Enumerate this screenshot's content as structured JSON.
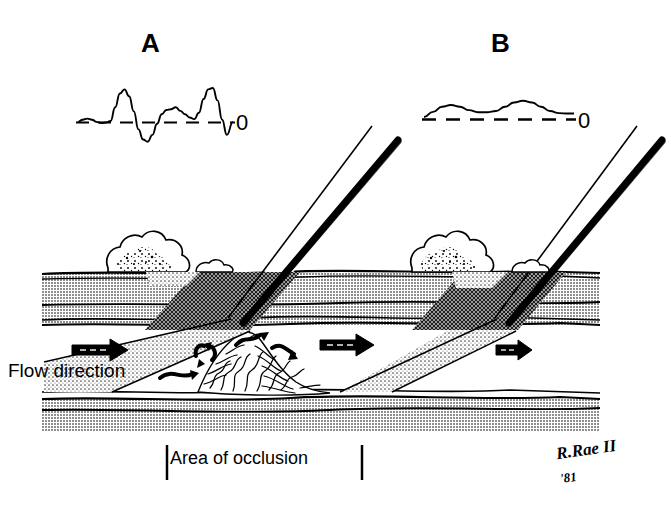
{
  "figure": {
    "panels": [
      {
        "id": "A",
        "label": "A",
        "zero_label": "0",
        "waveform_description": "high-amplitude biphasic turbulent spectral Doppler trace with spectral broadening",
        "baseline": "dashed"
      },
      {
        "id": "B",
        "label": "B",
        "zero_label": "0",
        "waveform_description": "low-amplitude damped monophasic spectral Doppler trace",
        "baseline": "dashed"
      }
    ],
    "annotations": {
      "flow_direction": "Flow direction",
      "area_of_occlusion": "Area of occlusion"
    },
    "signature": {
      "artist": "R.Rae II",
      "year": "'81"
    },
    "colors": {
      "ink": "#000000",
      "tissue_gray": "#a8a8a8",
      "beam_stipple": "#c9c9c9",
      "background": "#ffffff"
    }
  },
  "chart_data": [
    {
      "type": "line",
      "title": "A",
      "xlabel": "",
      "ylabel": "",
      "ylim": [
        -1.0,
        1.25
      ],
      "grid": false,
      "legend": "none",
      "baseline_value": 0,
      "baseline_label": "0",
      "baseline_style": "dashed",
      "x": [
        0,
        3,
        6,
        9,
        12,
        15,
        18,
        21,
        24,
        27,
        30,
        33,
        36,
        39,
        42,
        45,
        48,
        51,
        54,
        57,
        60,
        63,
        66,
        69,
        72,
        75,
        78,
        81,
        84,
        87,
        90,
        93,
        96,
        100
      ],
      "values": [
        0.02,
        0.1,
        0.14,
        0.1,
        0.02,
        -0.02,
        0.0,
        0.05,
        0.55,
        1.05,
        1.2,
        0.95,
        0.4,
        -0.25,
        -0.62,
        -0.7,
        -0.45,
        -0.05,
        0.3,
        0.45,
        0.48,
        0.55,
        0.42,
        0.3,
        0.18,
        0.12,
        0.35,
        0.85,
        1.2,
        1.25,
        0.8,
        0.1,
        -0.45,
        0.02
      ]
    },
    {
      "type": "line",
      "title": "B",
      "xlabel": "",
      "ylabel": "",
      "ylim": [
        -0.2,
        0.6
      ],
      "grid": false,
      "legend": "none",
      "baseline_value": 0,
      "baseline_label": "0",
      "baseline_style": "dashed",
      "x": [
        0,
        6,
        12,
        18,
        24,
        30,
        36,
        42,
        48,
        54,
        60,
        66,
        72,
        78,
        84,
        90,
        96,
        100
      ],
      "values": [
        0.06,
        0.18,
        0.3,
        0.34,
        0.3,
        0.22,
        0.17,
        0.17,
        0.2,
        0.3,
        0.4,
        0.44,
        0.4,
        0.3,
        0.2,
        0.15,
        0.14,
        0.14
      ]
    }
  ]
}
